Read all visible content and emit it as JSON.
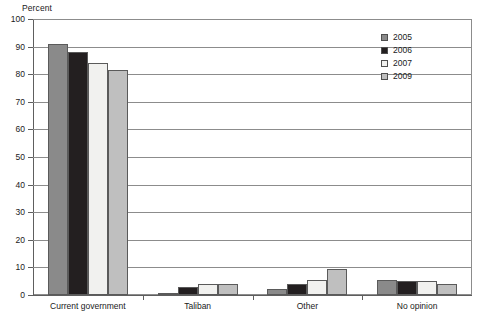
{
  "chart_data": {
    "type": "bar",
    "title": "",
    "subtitle": "",
    "xlabel": "",
    "ylabel": "Percent",
    "ylim": [
      0,
      100
    ],
    "yticks": [
      0,
      10,
      20,
      30,
      40,
      50,
      60,
      70,
      80,
      90,
      100
    ],
    "ytick_labels": [
      "0",
      "10",
      "20",
      "30",
      "40",
      "50",
      "60",
      "70",
      "80",
      "90",
      "100"
    ],
    "grid": true,
    "grid_axis": "y",
    "legend_position": "top-right",
    "categories": [
      "Current government",
      "Taliban",
      "Other",
      "No opinion"
    ],
    "series": [
      {
        "name": "2005",
        "color": "#8a8a8a",
        "values": [
          91,
          0.7,
          2,
          5.5
        ]
      },
      {
        "name": "2006",
        "color": "#231f20",
        "values": [
          88,
          3,
          4,
          5
        ]
      },
      {
        "name": "2007",
        "color": "#f1f1ef",
        "values": [
          84,
          4,
          5.5,
          5
        ]
      },
      {
        "name": "2009",
        "color": "#bfbfbf",
        "values": [
          81.5,
          4,
          9.5,
          4
        ]
      }
    ]
  },
  "legend": {
    "items": [
      {
        "label": "2005"
      },
      {
        "label": "2006"
      },
      {
        "label": "2007"
      },
      {
        "label": "2009"
      }
    ]
  }
}
